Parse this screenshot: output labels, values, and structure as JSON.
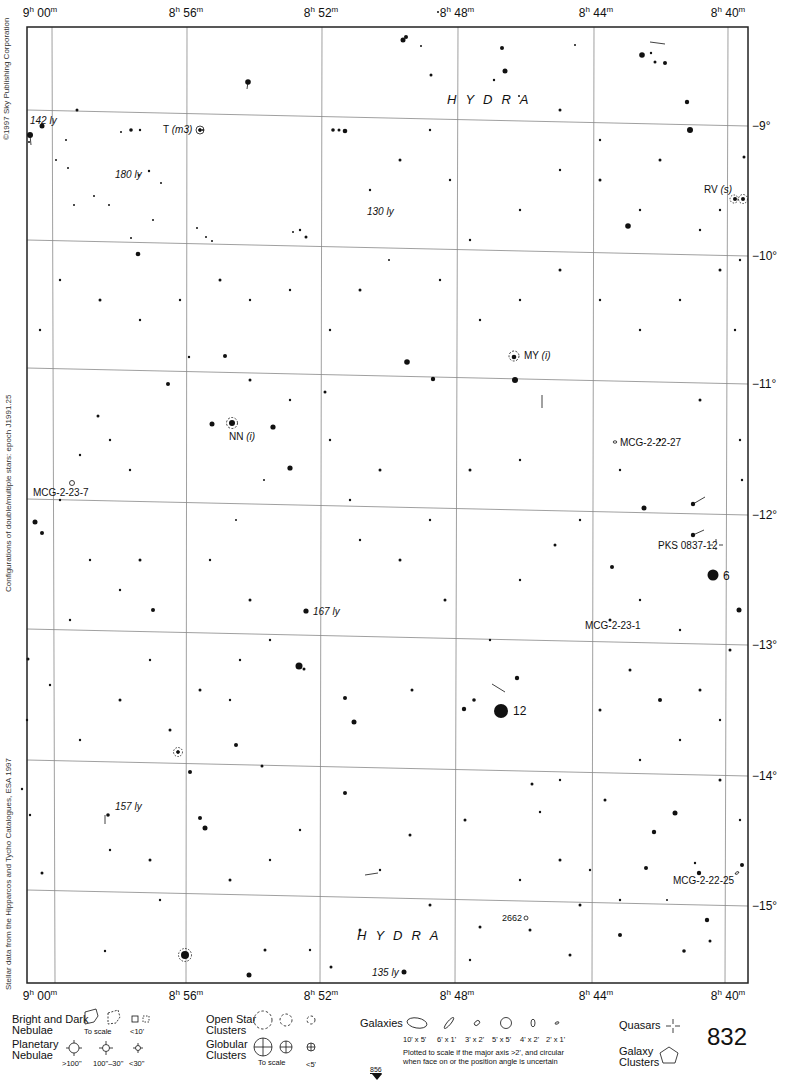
{
  "chart_title": "Hydra star chart",
  "page_number": "832",
  "next_page_ref": "856",
  "constellation": "HYDRA",
  "copyright": "©1997 Sky Publishing Corporation",
  "side_note_1": "Configurations of double/multiple stars: epoch J1991.25",
  "side_note_2": "Stellar data from the Hipparcos and Tycho Catalogues, ESA 1997",
  "ra_labels": [
    {
      "h": "9",
      "m": "00",
      "x": 40
    },
    {
      "h": "8",
      "m": "56",
      "x": 186
    },
    {
      "h": "8",
      "m": "52",
      "x": 321
    },
    {
      "h": "8",
      "m": "48",
      "x": 457
    },
    {
      "h": "8",
      "m": "44",
      "x": 596
    },
    {
      "h": "8",
      "m": "40",
      "x": 728
    }
  ],
  "dec_labels": [
    {
      "text": "−9°",
      "y": 126
    },
    {
      "text": "−10°",
      "y": 256
    },
    {
      "text": "−11°",
      "y": 384
    },
    {
      "text": "−12°",
      "y": 515
    },
    {
      "text": "−13°",
      "y": 645
    },
    {
      "text": "−14°",
      "y": 776
    },
    {
      "text": "−15°",
      "y": 906
    }
  ],
  "objects": [
    {
      "id": "t-m3",
      "label": "T",
      "suffix": "(m3)",
      "type": "variable"
    },
    {
      "id": "rv-s",
      "label": "RV",
      "suffix": "(s)",
      "type": "variable"
    },
    {
      "id": "my-i",
      "label": "MY",
      "suffix": "(i)",
      "type": "variable"
    },
    {
      "id": "nn-i",
      "label": "NN",
      "suffix": "(i)",
      "type": "variable"
    },
    {
      "id": "mcg-2-22-27",
      "label": "MCG-2-22-27",
      "type": "galaxy"
    },
    {
      "id": "mcg-2-23-7",
      "label": "MCG-2-23-7",
      "type": "galaxy"
    },
    {
      "id": "pks",
      "label": "PKS 0837-12",
      "type": "quasar"
    },
    {
      "id": "mcg-2-23-1",
      "label": "MCG-2-23-1",
      "type": "galaxy"
    },
    {
      "id": "mcg-2-22-25",
      "label": "MCG-2-22-25",
      "type": "galaxy"
    },
    {
      "id": "ngc2662",
      "label": "2662",
      "type": "galaxy"
    }
  ],
  "distances": [
    "142 ly",
    "180 ly",
    "130 ly",
    "167 ly",
    "157 ly",
    "135 ly"
  ],
  "star_numbers": [
    "6",
    "12"
  ],
  "legend": {
    "nebulae_bright_dark": "Bright and Dark\nNebulae",
    "to_scale": "To scale",
    "lt10": "<10'",
    "planetary": "Planetary\nNebulae",
    "pn_sizes": [
      ">100\"",
      "100\"–30\"",
      "<30\""
    ],
    "open_clusters": "Open Star\nClusters",
    "globular": "Globular\nClusters",
    "globular_to_scale": "To scale",
    "lt5": "<5'",
    "galaxies": "Galaxies",
    "galaxy_sizes": [
      "10' x 5'",
      "6' x 1'",
      "3' x 2'",
      "5' x 5'",
      "4' x 2'",
      "2' x 1'"
    ],
    "galaxy_note": "Plotted to scale if the major axis >2', and circular\nwhen face on or the position angle is uncertain",
    "quasars": "Quasars",
    "galaxy_clusters": "Galaxy\nClusters"
  },
  "stars": [
    [
      30,
      135,
      3
    ],
    [
      42,
      126,
      2.5
    ],
    [
      77,
      110,
      1.5
    ],
    [
      29,
      142,
      1
    ],
    [
      66,
      140,
      1
    ],
    [
      248,
      82,
      2.8
    ],
    [
      203,
      130,
      1
    ],
    [
      131,
      130,
      1.8
    ],
    [
      140,
      130,
      1.2
    ],
    [
      121,
      132,
      1
    ],
    [
      149,
      171,
      1.2
    ],
    [
      139,
      175,
      1
    ],
    [
      161,
      183,
      1
    ],
    [
      56,
      160,
      1
    ],
    [
      68,
      168,
      1
    ],
    [
      74,
      205,
      1
    ],
    [
      94,
      196,
      1
    ],
    [
      109,
      205,
      1
    ],
    [
      138,
      254,
      2.3
    ],
    [
      153,
      220,
      1
    ],
    [
      131,
      238,
      1
    ],
    [
      197,
      228,
      1
    ],
    [
      206,
      237,
      1
    ],
    [
      212,
      241,
      1
    ],
    [
      306,
      237,
      1.5
    ],
    [
      300,
      230,
      1.2
    ],
    [
      293,
      232,
      1
    ],
    [
      333,
      130,
      1.8
    ],
    [
      339,
      130,
      1.5
    ],
    [
      345,
      131,
      2.3
    ],
    [
      403,
      40,
      2.5
    ],
    [
      406,
      37,
      2
    ],
    [
      431,
      75,
      1.5
    ],
    [
      421,
      46,
      1
    ],
    [
      438,
      12,
      1
    ],
    [
      505,
      71,
      2.5
    ],
    [
      502,
      48,
      2
    ],
    [
      494,
      80,
      1.2
    ],
    [
      519,
      96,
      1
    ],
    [
      575,
      45,
      1
    ],
    [
      642,
      55,
      2.8
    ],
    [
      651,
      53,
      1.2
    ],
    [
      665,
      63,
      2
    ],
    [
      655,
      62,
      1.5
    ],
    [
      687,
      102,
      2.2
    ],
    [
      690,
      130,
      3
    ],
    [
      628,
      226,
      2.8
    ],
    [
      744,
      157,
      1.5
    ],
    [
      735,
      199,
      2
    ],
    [
      743,
      199,
      2
    ],
    [
      407,
      362,
      2.8
    ],
    [
      433,
      379,
      2.2
    ],
    [
      515,
      380,
      3
    ],
    [
      514,
      357,
      2.3
    ],
    [
      389,
      260,
      1
    ],
    [
      325,
      392,
      1.5
    ],
    [
      225,
      356,
      2
    ],
    [
      212,
      424,
      2.5
    ],
    [
      232,
      423,
      3
    ],
    [
      273,
      427,
      2.6
    ],
    [
      290,
      468,
      2.6
    ],
    [
      168,
      384,
      2
    ],
    [
      98,
      416,
      1.5
    ],
    [
      42,
      533,
      2
    ],
    [
      35,
      522,
      2.5
    ],
    [
      189,
      357,
      1.2
    ],
    [
      264,
      480,
      1
    ],
    [
      236,
      520,
      1
    ],
    [
      644,
      508,
      2.5
    ],
    [
      693,
      504,
      2.2
    ],
    [
      693,
      535,
      2.2
    ],
    [
      612,
      567,
      2
    ],
    [
      713,
      575,
      5.5
    ],
    [
      739,
      610,
      2.5
    ],
    [
      306,
      611,
      2.6
    ],
    [
      153,
      610,
      2
    ],
    [
      299,
      666,
      3.5
    ],
    [
      304,
      669,
      1.5
    ],
    [
      345,
      698,
      2
    ],
    [
      354,
      722,
      2.5
    ],
    [
      501,
      711,
      7
    ],
    [
      464,
      709,
      2.2
    ],
    [
      474,
      700,
      1.8
    ],
    [
      517,
      678,
      2.2
    ],
    [
      412,
      690,
      1.5
    ],
    [
      532,
      784,
      1.5
    ],
    [
      205,
      828,
      2.5
    ],
    [
      200,
      818,
      2
    ],
    [
      345,
      793,
      2
    ],
    [
      185,
      955,
      4
    ],
    [
      265,
      950,
      1.5
    ],
    [
      249,
      975,
      2.5
    ],
    [
      404,
      972,
      2.5
    ],
    [
      331,
      967,
      1.5
    ],
    [
      430,
      905,
      1.5
    ],
    [
      646,
      868,
      2
    ],
    [
      654,
      832,
      2.2
    ],
    [
      699,
      873,
      2.2
    ],
    [
      675,
      813,
      2.5
    ],
    [
      695,
      863,
      1.2
    ],
    [
      742,
      865,
      2
    ],
    [
      667,
      900,
      1
    ],
    [
      707,
      920,
      2.2
    ],
    [
      710,
      941,
      1.5
    ],
    [
      684,
      951,
      1.8
    ],
    [
      105,
      951,
      1.2
    ],
    [
      108,
      815,
      1.8
    ],
    [
      42,
      873,
      1.5
    ],
    [
      30,
      815,
      1.2
    ],
    [
      22,
      789,
      1.2
    ],
    [
      28,
      659,
      1.5
    ],
    [
      27,
      720,
      1.2
    ],
    [
      50,
      685,
      1.2
    ],
    [
      170,
      730,
      1.5
    ],
    [
      190,
      772,
      2
    ],
    [
      236,
      745,
      2
    ],
    [
      262,
      766,
      1.5
    ],
    [
      410,
      835,
      1.5
    ],
    [
      465,
      820,
      1.5
    ],
    [
      540,
      812,
      1.2
    ],
    [
      580,
      905,
      1.5
    ],
    [
      620,
      935,
      2
    ],
    [
      570,
      955,
      1.5
    ],
    [
      470,
      960,
      1.2
    ],
    [
      480,
      927,
      1.5
    ],
    [
      560,
      780,
      1.2
    ],
    [
      600,
      710,
      1.5
    ],
    [
      630,
      670,
      1.5
    ],
    [
      660,
      700,
      2
    ],
    [
      700,
      690,
      1.5
    ],
    [
      720,
      780,
      1.5
    ],
    [
      740,
      820,
      1.2
    ],
    [
      605,
      800,
      1.5
    ],
    [
      445,
      600,
      1.5
    ],
    [
      490,
      640,
      1.2
    ],
    [
      520,
      580,
      1.2
    ],
    [
      555,
      545,
      1.5
    ],
    [
      580,
      520,
      1.2
    ],
    [
      520,
      460,
      1.2
    ],
    [
      470,
      470,
      1.5
    ],
    [
      430,
      520,
      1.2
    ],
    [
      400,
      560,
      1.5
    ],
    [
      360,
      540,
      1.2
    ],
    [
      350,
      500,
      1.2
    ],
    [
      380,
      470,
      1.5
    ],
    [
      330,
      440,
      1.2
    ],
    [
      290,
      400,
      1.2
    ],
    [
      250,
      380,
      1.5
    ],
    [
      130,
      470,
      1.2
    ],
    [
      110,
      440,
      1.2
    ],
    [
      80,
      455,
      1.2
    ],
    [
      60,
      500,
      1.2
    ],
    [
      140,
      560,
      1.5
    ],
    [
      120,
      590,
      1.2
    ],
    [
      90,
      560,
      1.2
    ],
    [
      70,
      620,
      1.2
    ],
    [
      210,
      560,
      1.2
    ],
    [
      250,
      600,
      1.5
    ],
    [
      270,
      640,
      1.2
    ],
    [
      240,
      660,
      1.2
    ],
    [
      200,
      690,
      1.5
    ],
    [
      230,
      700,
      1.2
    ],
    [
      150,
      660,
      1.2
    ],
    [
      120,
      700,
      1.5
    ],
    [
      80,
      740,
      1.2
    ],
    [
      110,
      850,
      1.2
    ],
    [
      150,
      860,
      1.5
    ],
    [
      160,
      900,
      1.2
    ],
    [
      230,
      880,
      1.5
    ],
    [
      270,
      860,
      1.2
    ],
    [
      300,
      830,
      1.2
    ],
    [
      380,
      870,
      1.2
    ],
    [
      360,
      930,
      1.5
    ],
    [
      310,
      950,
      1.2
    ],
    [
      520,
      880,
      1.2
    ],
    [
      560,
      860,
      1.5
    ],
    [
      590,
      870,
      1.2
    ],
    [
      530,
      930,
      1.5
    ],
    [
      620,
      900,
      1.2
    ],
    [
      440,
      280,
      1.2
    ],
    [
      470,
      240,
      1.2
    ],
    [
      520,
      210,
      1.2
    ],
    [
      560,
      170,
      1.2
    ],
    [
      600,
      180,
      1.5
    ],
    [
      640,
      210,
      1.2
    ],
    [
      660,
      160,
      1.5
    ],
    [
      700,
      230,
      1.2
    ],
    [
      720,
      270,
      1.5
    ],
    [
      680,
      300,
      1.2
    ],
    [
      640,
      330,
      1.2
    ],
    [
      600,
      300,
      1.2
    ],
    [
      560,
      270,
      1.5
    ],
    [
      520,
      300,
      1.2
    ],
    [
      480,
      320,
      1.2
    ],
    [
      360,
      290,
      1.5
    ],
    [
      330,
      330,
      1.2
    ],
    [
      290,
      290,
      1.2
    ],
    [
      250,
      300,
      1.2
    ],
    [
      220,
      280,
      1.5
    ],
    [
      180,
      300,
      1.2
    ],
    [
      140,
      320,
      1.2
    ],
    [
      100,
      300,
      1.5
    ],
    [
      60,
      280,
      1.2
    ],
    [
      40,
      330,
      1.2
    ],
    [
      370,
      190,
      1.2
    ],
    [
      400,
      160,
      1.5
    ],
    [
      430,
      130,
      1.2
    ],
    [
      450,
      180,
      1.2
    ],
    [
      560,
      110,
      1.5
    ],
    [
      600,
      140,
      1.2
    ],
    [
      720,
      210,
      1.2
    ],
    [
      740,
      260,
      1.2
    ],
    [
      735,
      330,
      1.2
    ],
    [
      700,
      400,
      1.5
    ],
    [
      660,
      440,
      1.2
    ],
    [
      620,
      470,
      1.2
    ],
    [
      740,
      440,
      1.2
    ],
    [
      742,
      480,
      1.2
    ],
    [
      610,
      620,
      1.5
    ],
    [
      640,
      600,
      1.2
    ],
    [
      680,
      630,
      1.2
    ],
    [
      730,
      650,
      1.5
    ],
    [
      720,
      720,
      1.2
    ],
    [
      680,
      740,
      1.2
    ],
    [
      640,
      760,
      1.2
    ]
  ]
}
